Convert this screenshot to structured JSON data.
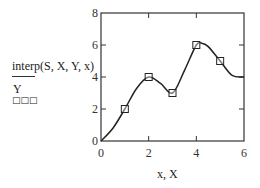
{
  "chart_data": {
    "type": "line",
    "title": "",
    "xlabel": "x, X",
    "ylabel": "interp(S, X, Y, x) / Y",
    "xlim": [
      0,
      6
    ],
    "ylim": [
      0,
      8
    ],
    "x_ticks": [
      "0",
      "2",
      "4",
      "6"
    ],
    "y_ticks": [
      "0",
      "2",
      "4",
      "6",
      "8"
    ],
    "grid": false,
    "legend": null,
    "series": [
      {
        "name": "interp(S,X,Y,x)",
        "style": "solid line",
        "x": [
          0,
          0.5,
          1,
          1.5,
          2,
          2.5,
          3,
          3.5,
          4,
          4.25,
          4.5,
          5,
          5.5,
          6
        ],
        "values": [
          0,
          0.8,
          2.0,
          3.3,
          4.0,
          3.6,
          3.0,
          4.4,
          6.0,
          6.1,
          5.9,
          5.0,
          4.1,
          4.0
        ]
      },
      {
        "name": "Y",
        "style": "square markers",
        "x": [
          1,
          2,
          3,
          4,
          5
        ],
        "values": [
          2,
          4,
          3,
          6,
          5
        ]
      }
    ]
  },
  "labels": {
    "y_top": "interp(S, X, Y, x)",
    "y_bottom": "Y",
    "y_placeholder": "□□□",
    "x_axis": "x, X"
  }
}
